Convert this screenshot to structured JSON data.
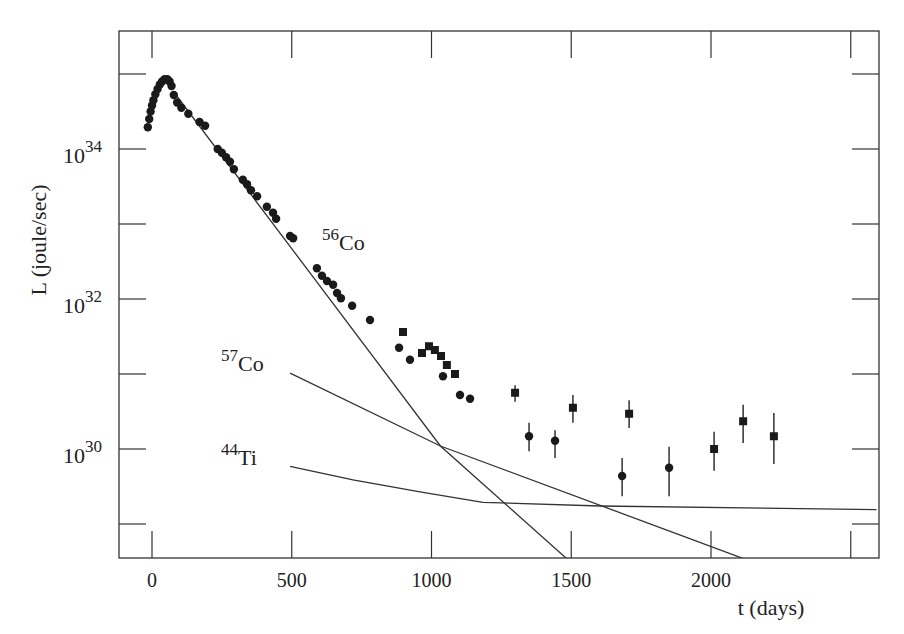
{
  "chart_data": {
    "type": "scatter",
    "title": "",
    "xlabel": "t (days)",
    "ylabel": "L (joule/sec)",
    "xlim": [
      -130,
      2600
    ],
    "ylim_log10": [
      28.53,
      35.55
    ],
    "yscale": "log",
    "grid": false,
    "x_ticks": [
      0,
      500,
      1000,
      1500,
      2000,
      2500
    ],
    "x_tick_labels": [
      "0",
      "500",
      "1000",
      "1500",
      "2000",
      ""
    ],
    "y_ticks_log10": [
      29,
      30,
      31,
      32,
      33,
      34,
      35
    ],
    "y_tick_labels": [
      {
        "log10": 30,
        "base": "10",
        "exp": "30"
      },
      {
        "log10": 32,
        "base": "10",
        "exp": "32"
      },
      {
        "log10": 34,
        "base": "10",
        "exp": "34"
      }
    ],
    "series": [
      {
        "name": "bolometric light curve (circles)",
        "marker": "circle",
        "points": [
          {
            "t": -15,
            "log10L": 34.29
          },
          {
            "t": -10,
            "log10L": 34.4
          },
          {
            "t": -5,
            "log10L": 34.5
          },
          {
            "t": 0,
            "log10L": 34.58
          },
          {
            "t": 5,
            "log10L": 34.65
          },
          {
            "t": 12,
            "log10L": 34.73
          },
          {
            "t": 20,
            "log10L": 34.8
          },
          {
            "t": 28,
            "log10L": 34.86
          },
          {
            "t": 36,
            "log10L": 34.9
          },
          {
            "t": 45,
            "log10L": 34.93
          },
          {
            "t": 55,
            "log10L": 34.93
          },
          {
            "t": 63,
            "log10L": 34.9
          },
          {
            "t": 70,
            "log10L": 34.84
          },
          {
            "t": 78,
            "log10L": 34.72
          },
          {
            "t": 90,
            "log10L": 34.62
          },
          {
            "t": 105,
            "log10L": 34.55
          },
          {
            "t": 130,
            "log10L": 34.47
          },
          {
            "t": 170,
            "log10L": 34.36
          },
          {
            "t": 190,
            "log10L": 34.31
          },
          {
            "t": 235,
            "log10L": 34.0
          },
          {
            "t": 250,
            "log10L": 33.95
          },
          {
            "t": 265,
            "log10L": 33.89
          },
          {
            "t": 279,
            "log10L": 33.83
          },
          {
            "t": 293,
            "log10L": 33.73
          },
          {
            "t": 325,
            "log10L": 33.59
          },
          {
            "t": 340,
            "log10L": 33.53
          },
          {
            "t": 354,
            "log10L": 33.45
          },
          {
            "t": 376,
            "log10L": 33.37
          },
          {
            "t": 411,
            "log10L": 33.23
          },
          {
            "t": 433,
            "log10L": 33.15
          },
          {
            "t": 444,
            "log10L": 33.07
          },
          {
            "t": 494,
            "log10L": 32.84
          },
          {
            "t": 505,
            "log10L": 32.81
          },
          {
            "t": 590,
            "log10L": 32.41
          },
          {
            "t": 608,
            "log10L": 32.31
          },
          {
            "t": 626,
            "log10L": 32.24
          },
          {
            "t": 648,
            "log10L": 32.19
          },
          {
            "t": 662,
            "log10L": 32.08
          },
          {
            "t": 676,
            "log10L": 32.01
          },
          {
            "t": 716,
            "log10L": 31.91
          },
          {
            "t": 780,
            "log10L": 31.72
          },
          {
            "t": 884,
            "log10L": 31.35
          },
          {
            "t": 923,
            "log10L": 31.19
          },
          {
            "t": 1041,
            "log10L": 30.97
          },
          {
            "t": 1102,
            "log10L": 30.72
          },
          {
            "t": 1138,
            "log10L": 30.67
          },
          {
            "t": 1349,
            "log10L": 30.17,
            "err_lo": 29.97,
            "err_hi": 30.35
          },
          {
            "t": 1442,
            "log10L": 30.11,
            "err_lo": 29.88,
            "err_hi": 30.25
          },
          {
            "t": 1682,
            "log10L": 29.64,
            "err_lo": 29.37,
            "err_hi": 29.88
          },
          {
            "t": 1850,
            "log10L": 29.75,
            "err_lo": 29.37,
            "err_hi": 30.03
          }
        ]
      },
      {
        "name": "light curve (squares)",
        "marker": "square",
        "points": [
          {
            "t": 898,
            "log10L": 31.56
          },
          {
            "t": 966,
            "log10L": 31.28
          },
          {
            "t": 991,
            "log10L": 31.37
          },
          {
            "t": 1012,
            "log10L": 31.32
          },
          {
            "t": 1034,
            "log10L": 31.24
          },
          {
            "t": 1055,
            "log10L": 31.12
          },
          {
            "t": 1084,
            "log10L": 31.0
          },
          {
            "t": 1299,
            "log10L": 30.75,
            "err_lo": 30.63,
            "err_hi": 30.85
          },
          {
            "t": 1506,
            "log10L": 30.55,
            "err_lo": 30.35,
            "err_hi": 30.72
          },
          {
            "t": 1707,
            "log10L": 30.47,
            "err_lo": 30.28,
            "err_hi": 30.65
          },
          {
            "t": 2011,
            "log10L": 30.0,
            "err_lo": 29.71,
            "err_hi": 30.23
          },
          {
            "t": 2115,
            "log10L": 30.37,
            "err_lo": 30.08,
            "err_hi": 30.59
          },
          {
            "t": 2225,
            "log10L": 30.17,
            "err_lo": 29.8,
            "err_hi": 30.48
          }
        ]
      }
    ],
    "model_curves": [
      {
        "name": "56Co",
        "label_mass": "56",
        "label_elem": "Co",
        "points": [
          {
            "t": 86,
            "log10L": 34.72
          },
          {
            "t": 1032,
            "log10L": 30.04
          },
          {
            "t": 1486,
            "log10L": 28.53
          }
        ]
      },
      {
        "name": "57Co",
        "label_mass": "57",
        "label_elem": "Co",
        "points": [
          {
            "t": 494,
            "log10L": 31.01
          },
          {
            "t": 1032,
            "log10L": 30.04
          },
          {
            "t": 2122,
            "log10L": 28.53
          }
        ]
      },
      {
        "name": "44Ti",
        "label_mass": "44",
        "label_elem": "Ti",
        "points": [
          {
            "t": 494,
            "log10L": 29.77
          },
          {
            "t": 719,
            "log10L": 29.59
          },
          {
            "t": 959,
            "log10L": 29.43
          },
          {
            "t": 1184,
            "log10L": 29.29
          },
          {
            "t": 1603,
            "log10L": 29.24
          },
          {
            "t": 2592,
            "log10L": 29.19
          }
        ]
      }
    ],
    "annotations": [
      {
        "mass": "56",
        "elem": "Co",
        "near_t": 750,
        "near_log10L": 32.9
      },
      {
        "mass": "57",
        "elem": "Co",
        "near_t": 350,
        "near_log10L": 31.0
      },
      {
        "mass": "44",
        "elem": "Ti",
        "near_t": 350,
        "near_log10L": 29.8
      }
    ]
  }
}
